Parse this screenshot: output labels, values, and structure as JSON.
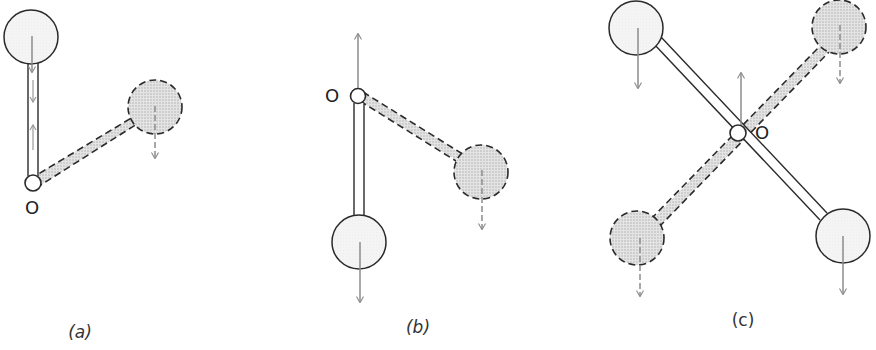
{
  "diagram": {
    "type": "rigid-pendulum-balance-illustration",
    "colors": {
      "stroke": "#2a2a2a",
      "arrow": "#8c8c8c",
      "solid_ball_fill": "#f2f2f2",
      "dashed_ball_fill": "#d6d6d6",
      "dashed_rod_fill": "#d9d9d9"
    },
    "panels": [
      {
        "id": "a",
        "caption": "(a)",
        "pivot_label": "O",
        "description": "Solid rod with ball above pivot O (vertical up); dashed rod with ball tilted to the right-up",
        "pivot": {
          "x": 33,
          "y": 183
        },
        "balls": [
          {
            "style": "solid",
            "x": 31,
            "y": 37,
            "force": "down"
          },
          {
            "style": "dashed",
            "x": 155,
            "y": 107,
            "force": "down"
          }
        ]
      },
      {
        "id": "b",
        "caption": "(b)",
        "pivot_label": "O",
        "description": "Solid rod with ball hanging below pivot O; dashed rod with ball tilted down-right; upward reaction force at pivot",
        "pivot": {
          "x": 358,
          "y": 96
        },
        "balls": [
          {
            "style": "solid",
            "x": 359,
            "y": 242,
            "force": "down"
          },
          {
            "style": "dashed",
            "x": 481,
            "y": 172,
            "force": "down"
          }
        ],
        "pivot_force": "up"
      },
      {
        "id": "c",
        "caption": "(c)",
        "pivot_label": "O",
        "description": "Symmetric X arrangement: two solid-rod balls and two dashed-rod balls about central pivot O; upward reaction force at pivot",
        "pivot": {
          "x": 738,
          "y": 133
        },
        "balls": [
          {
            "style": "solid",
            "x": 636,
            "y": 28,
            "force": "down"
          },
          {
            "style": "solid",
            "x": 843,
            "y": 236,
            "force": "down"
          },
          {
            "style": "dashed",
            "x": 839,
            "y": 27,
            "force": "down"
          },
          {
            "style": "dashed",
            "x": 637,
            "y": 238,
            "force": "down"
          }
        ],
        "pivot_force": "up"
      }
    ]
  }
}
